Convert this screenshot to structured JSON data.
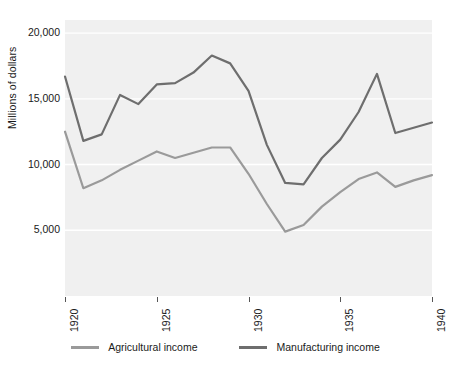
{
  "chart_data": {
    "type": "line",
    "title": "",
    "subtitle": "",
    "xlabel": "",
    "ylabel": "Millions of dollars",
    "x": [
      1920,
      1921,
      1922,
      1923,
      1924,
      1925,
      1926,
      1927,
      1928,
      1929,
      1930,
      1931,
      1932,
      1933,
      1934,
      1935,
      1936,
      1937,
      1938,
      1939,
      1940
    ],
    "xlim": [
      1920,
      1940
    ],
    "ylim": [
      0,
      21000
    ],
    "grid": true,
    "grid_axis": "y",
    "legend_position": "bottom",
    "xtick_labels": [
      "1920",
      "1925",
      "1930",
      "1935",
      "1940"
    ],
    "xtick_values": [
      1920,
      1925,
      1930,
      1935,
      1940
    ],
    "xtick_rotation": 90,
    "ytick_labels": [
      "5,000",
      "10,000",
      "15,000",
      "20,000"
    ],
    "ytick_values": [
      5000,
      10000,
      15000,
      20000
    ],
    "series": [
      {
        "name": "Agricultural income",
        "color": "#9a9a9a",
        "values": [
          12500,
          8200,
          8800,
          9600,
          10300,
          11000,
          10500,
          10900,
          11300,
          11300,
          9300,
          7000,
          4900,
          5400,
          6800,
          7900,
          8900,
          9400,
          8300,
          8800,
          9200
        ]
      },
      {
        "name": "Manufacturing income",
        "color": "#6e6e6e",
        "values": [
          16700,
          11800,
          12300,
          15300,
          14600,
          16100,
          16200,
          17000,
          18300,
          17700,
          15600,
          11500,
          8600,
          8500,
          10500,
          11900,
          14000,
          16900,
          12400,
          12800,
          13200
        ]
      }
    ]
  },
  "legend": {
    "items": [
      {
        "label": "Agricultural income",
        "color": "#9a9a9a"
      },
      {
        "label": "Manufacturing income",
        "color": "#6e6e6e"
      }
    ]
  },
  "colors": {
    "plot_background": "#f0f0f0",
    "gridline": "#ffffff",
    "text": "#1a1a1a",
    "tick_mark": "#555555",
    "page_background": "#ffffff"
  }
}
